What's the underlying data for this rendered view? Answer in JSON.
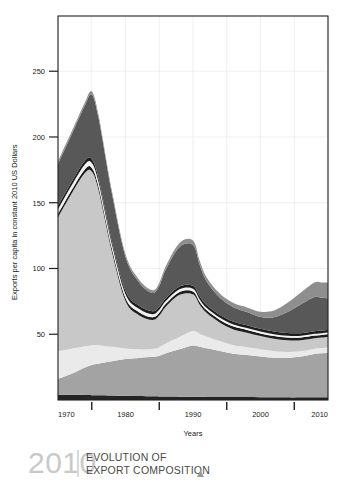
{
  "chart_data": {
    "type": "area",
    "title": "",
    "xlabel": "Years",
    "ylabel": "Exports per capita in constant 2010 US Dollars",
    "xlim": [
      1970,
      2010
    ],
    "ylim": [
      0,
      292
    ],
    "grid": true,
    "legend_position": "none",
    "xticks": [
      1970,
      1980,
      1990,
      2000,
      2010
    ],
    "xticks_minor": [
      1975,
      1985,
      1995,
      2005
    ],
    "yticks": [
      50,
      100,
      150,
      200,
      250
    ],
    "x": [
      1970,
      1972,
      1974,
      1975,
      1976,
      1978,
      1980,
      1982,
      1984,
      1985,
      1986,
      1988,
      1990,
      1991,
      1992,
      1994,
      1996,
      1998,
      2000,
      2002,
      2004,
      2006,
      2008,
      2009,
      2010
    ],
    "series": [
      {
        "name": "series-1-base-dark",
        "color": "#242424",
        "values": [
          4.0,
          3.9,
          3.8,
          3.7,
          3.6,
          3.4,
          3.2,
          3.0,
          2.8,
          2.7,
          2.6,
          2.5,
          2.4,
          2.4,
          2.3,
          2.3,
          2.2,
          2.2,
          2.1,
          2.1,
          2.0,
          2.0,
          2.0,
          2.0,
          2.0
        ]
      },
      {
        "name": "series-2-mid-gray",
        "color": "#a3a3a3",
        "values": [
          12.0,
          16.0,
          21.0,
          23.0,
          24.0,
          26.0,
          28.0,
          29.0,
          30.0,
          31.0,
          33.0,
          36.0,
          39.0,
          38.0,
          37.0,
          35.0,
          33.0,
          32.0,
          31.0,
          30.0,
          30.0,
          31.0,
          33.0,
          33.5,
          34.0
        ]
      },
      {
        "name": "series-3-light",
        "color": "#eaeaea",
        "values": [
          21.0,
          19.0,
          16.0,
          15.0,
          14.0,
          11.0,
          8.0,
          6.5,
          6.0,
          6.5,
          7.5,
          9.5,
          11.0,
          10.0,
          9.0,
          7.5,
          6.5,
          6.0,
          5.5,
          5.0,
          4.5,
          4.0,
          4.0,
          4.0,
          4.0
        ]
      },
      {
        "name": "series-4-pale-gray",
        "color": "#c8c8c8",
        "values": [
          102.0,
          118.0,
          132.0,
          132.0,
          118.0,
          72.0,
          36.0,
          26.0,
          22.0,
          24.0,
          28.0,
          32.0,
          28.0,
          22.0,
          18.0,
          14.0,
          12.0,
          11.0,
          10.0,
          9.5,
          9.0,
          8.5,
          8.0,
          8.0,
          8.0
        ]
      },
      {
        "name": "series-5-outline-dark",
        "color": "#1e1e1e",
        "values": [
          2.5,
          2.6,
          2.7,
          2.8,
          2.7,
          2.5,
          2.4,
          2.3,
          2.2,
          2.2,
          2.2,
          2.2,
          2.2,
          2.2,
          2.1,
          2.1,
          2.1,
          2.1,
          2.0,
          2.0,
          2.0,
          2.0,
          2.0,
          2.0,
          2.0
        ]
      },
      {
        "name": "series-6-white-band",
        "color": "#f2f2f2",
        "values": [
          3.5,
          3.6,
          3.8,
          3.8,
          3.6,
          3.2,
          2.8,
          2.5,
          2.2,
          2.2,
          2.1,
          2.0,
          2.0,
          1.9,
          1.8,
          1.7,
          1.6,
          1.5,
          1.5,
          1.4,
          1.4,
          1.3,
          1.3,
          1.3,
          1.3
        ]
      },
      {
        "name": "series-7-outline-dark-2",
        "color": "#1e1e1e",
        "values": [
          2.5,
          2.6,
          2.8,
          2.8,
          2.7,
          2.5,
          2.4,
          2.3,
          2.2,
          2.2,
          2.2,
          2.2,
          2.2,
          2.2,
          2.1,
          2.1,
          2.1,
          2.1,
          2.0,
          2.0,
          2.0,
          2.0,
          2.0,
          2.0,
          2.0
        ]
      },
      {
        "name": "series-8-dark-gray",
        "color": "#585858",
        "values": [
          32.0,
          36.0,
          42.0,
          49.0,
          46.0,
          36.0,
          26.0,
          18.0,
          14.0,
          16.0,
          22.0,
          30.0,
          31.0,
          24.0,
          18.0,
          13.0,
          11.0,
          10.0,
          9.0,
          11.0,
          16.0,
          22.0,
          26.0,
          25.0,
          24.0
        ]
      },
      {
        "name": "series-9-top-gray",
        "color": "#8e8e8e",
        "values": [
          2.0,
          2.2,
          2.4,
          2.5,
          2.4,
          2.2,
          2.0,
          2.0,
          2.0,
          2.2,
          2.5,
          3.0,
          3.5,
          3.2,
          3.0,
          3.0,
          3.2,
          3.5,
          4.0,
          5.0,
          7.0,
          9.0,
          11.0,
          11.5,
          12.0
        ]
      }
    ]
  },
  "axis": {
    "ylabel": "Exports per capita in constant 2010 US Dollars",
    "xlabel": "Years",
    "ytick_labels": [
      "50",
      "100",
      "150",
      "200",
      "250"
    ],
    "xtick_labels": [
      "1970",
      "1980",
      "1990",
      "2000",
      "2010"
    ]
  },
  "caption": {
    "year": "2010",
    "line1": "EVOLUTION OF",
    "line2": "EXPORT COMPOSITION",
    "marker": "triangle-up-icon"
  },
  "colors": {
    "plot_border": "#231f20",
    "gridline": "#e8e8e8",
    "text": "#1a1a1a",
    "caption_year": "#c9c9c9",
    "caption_text": "#4a4a4a",
    "divider": "#c9c9c9"
  }
}
